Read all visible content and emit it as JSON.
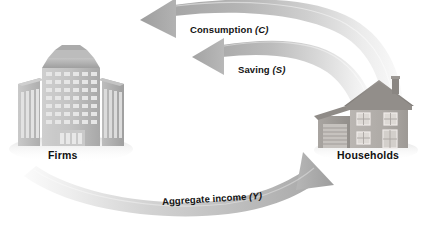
{
  "diagram": {
    "background_color": "#ffffff",
    "entities": [
      {
        "id": "firms",
        "label": "Firms",
        "icon": "office-building-icon",
        "position": "left"
      },
      {
        "id": "households",
        "label": "Households",
        "icon": "house-icon",
        "position": "right"
      }
    ],
    "flows": [
      {
        "id": "consumption",
        "text": "Consumption",
        "symbol": "(C)",
        "from": "households",
        "to": "firms",
        "direction": "left",
        "color": "#b4b4b4"
      },
      {
        "id": "saving",
        "text": "Saving",
        "symbol": "(S)",
        "from": "households",
        "to": "firms",
        "direction": "left",
        "color": "#b8b8b8"
      },
      {
        "id": "aggregate-income",
        "text": "Aggregate income",
        "symbol": "(Y)",
        "from": "firms",
        "to": "households",
        "direction": "right",
        "color": "#bdbdbd"
      }
    ],
    "palette": {
      "arrow_dark": "#a9a9a9",
      "arrow_mid": "#c3c3c3",
      "arrow_light": "#f3f3f3",
      "building_light": "#d5d5d5",
      "building_mid": "#b9b9b9",
      "building_dark": "#9a9a9a",
      "house_body": "#b0aca8",
      "house_roof": "#8e8a86",
      "text": "#131313"
    }
  }
}
